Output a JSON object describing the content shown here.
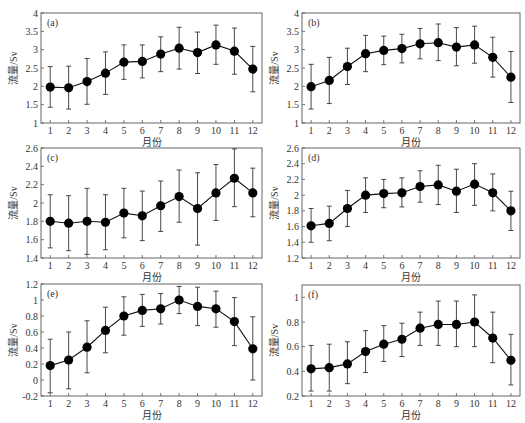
{
  "figure": {
    "xlabel": "月份",
    "ylabel": "流量/Sv",
    "months": [
      "1",
      "2",
      "3",
      "4",
      "5",
      "6",
      "7",
      "8",
      "9",
      "10",
      "11",
      "12"
    ]
  },
  "chart_data": [
    {
      "type": "line",
      "panel": "(a)",
      "xlabel": "月份",
      "ylabel": "流量/Sv",
      "x": [
        1,
        2,
        3,
        4,
        5,
        6,
        7,
        8,
        9,
        10,
        11,
        12
      ],
      "ylim": [
        1,
        4
      ],
      "yticks": [
        "1",
        "1.5",
        "2",
        "2.5",
        "3",
        "3.5",
        "4"
      ],
      "yticks_num": [
        1,
        1.5,
        2,
        2.5,
        3,
        3.5,
        4
      ],
      "values": [
        1.98,
        1.96,
        2.13,
        2.36,
        2.66,
        2.68,
        2.88,
        3.04,
        2.92,
        3.13,
        2.96,
        2.47
      ],
      "err_low": [
        1.43,
        1.38,
        1.51,
        1.78,
        2.19,
        2.23,
        2.4,
        2.47,
        2.35,
        2.6,
        2.33,
        1.85
      ],
      "err_high": [
        2.54,
        2.55,
        2.76,
        2.94,
        3.13,
        3.13,
        3.35,
        3.61,
        3.48,
        3.67,
        3.59,
        3.09
      ],
      "grid": false,
      "markers": "filled-circle",
      "frame": {
        "left": 41,
        "top": 13,
        "right": 262,
        "bottom": 123
      }
    },
    {
      "type": "line",
      "panel": "(b)",
      "xlabel": "月份",
      "ylabel": "流量/Sv",
      "x": [
        1,
        2,
        3,
        4,
        5,
        6,
        7,
        8,
        9,
        10,
        11,
        12
      ],
      "ylim": [
        1,
        4
      ],
      "yticks": [
        "1",
        "1.5",
        "2",
        "2.5",
        "3",
        "3.5",
        "4"
      ],
      "yticks_num": [
        1,
        1.5,
        2,
        2.5,
        3,
        3.5,
        4
      ],
      "values": [
        1.99,
        2.16,
        2.54,
        2.89,
        2.98,
        3.03,
        3.16,
        3.19,
        3.07,
        3.13,
        2.79,
        2.25
      ],
      "err_low": [
        1.38,
        1.53,
        2.05,
        2.4,
        2.59,
        2.64,
        2.75,
        2.7,
        2.56,
        2.63,
        2.25,
        1.56
      ],
      "err_high": [
        2.6,
        2.79,
        3.04,
        3.39,
        3.37,
        3.42,
        3.58,
        3.7,
        3.6,
        3.64,
        3.34,
        2.95
      ],
      "grid": false,
      "markers": "filled-circle",
      "frame": {
        "left": 302,
        "top": 13,
        "right": 520,
        "bottom": 123
      }
    },
    {
      "type": "line",
      "panel": "(c)",
      "xlabel": "月份",
      "ylabel": "流量/Sv",
      "x": [
        1,
        2,
        3,
        4,
        5,
        6,
        7,
        8,
        9,
        10,
        11,
        12
      ],
      "ylim": [
        1.4,
        2.6
      ],
      "yticks": [
        "1.4",
        "1.6",
        "1.8",
        "2",
        "2.2",
        "2.4",
        "2.6"
      ],
      "yticks_num": [
        1.4,
        1.6,
        1.8,
        2.0,
        2.2,
        2.4,
        2.6
      ],
      "values": [
        1.8,
        1.78,
        1.8,
        1.79,
        1.89,
        1.86,
        1.97,
        2.07,
        1.94,
        2.11,
        2.27,
        2.11
      ],
      "err_low": [
        1.51,
        1.48,
        1.44,
        1.49,
        1.62,
        1.59,
        1.69,
        1.79,
        1.54,
        1.81,
        1.96,
        1.85
      ],
      "err_high": [
        2.09,
        2.08,
        2.16,
        2.09,
        2.16,
        2.13,
        2.24,
        2.36,
        2.33,
        2.42,
        2.59,
        2.38
      ],
      "grid": false,
      "markers": "filled-circle",
      "frame": {
        "left": 41,
        "top": 148,
        "right": 262,
        "bottom": 258
      }
    },
    {
      "type": "line",
      "panel": "(d)",
      "xlabel": "月份",
      "ylabel": "流量/Sv",
      "x": [
        1,
        2,
        3,
        4,
        5,
        6,
        7,
        8,
        9,
        10,
        11,
        12
      ],
      "ylim": [
        1.2,
        2.6
      ],
      "yticks": [
        "1.2",
        "1.4",
        "1.6",
        "1.8",
        "2",
        "2.2",
        "2.4",
        "2.6"
      ],
      "yticks_num": [
        1.2,
        1.4,
        1.6,
        1.8,
        2.0,
        2.2,
        2.4,
        2.6
      ],
      "values": [
        1.61,
        1.64,
        1.83,
        2.0,
        2.02,
        2.03,
        2.11,
        2.13,
        2.05,
        2.14,
        2.03,
        1.8
      ],
      "err_low": [
        1.4,
        1.42,
        1.6,
        1.78,
        1.84,
        1.85,
        1.91,
        1.88,
        1.78,
        1.87,
        1.8,
        1.55
      ],
      "err_high": [
        1.83,
        1.86,
        2.06,
        2.22,
        2.2,
        2.22,
        2.31,
        2.38,
        2.33,
        2.4,
        2.27,
        2.05
      ],
      "grid": false,
      "markers": "filled-circle",
      "frame": {
        "left": 302,
        "top": 148,
        "right": 520,
        "bottom": 258
      }
    },
    {
      "type": "line",
      "panel": "(e)",
      "xlabel": "月份",
      "ylabel": "流量/Sv",
      "x": [
        1,
        2,
        3,
        4,
        5,
        6,
        7,
        8,
        9,
        10,
        11,
        12
      ],
      "ylim": [
        -0.2,
        1.2
      ],
      "yticks": [
        "-0.2",
        "0",
        "0.2",
        "0.4",
        "0.6",
        "0.8",
        "1",
        "1.2"
      ],
      "yticks_num": [
        -0.2,
        0,
        0.2,
        0.4,
        0.6,
        0.8,
        1.0,
        1.2
      ],
      "values": [
        0.18,
        0.25,
        0.41,
        0.62,
        0.8,
        0.87,
        0.89,
        1.0,
        0.92,
        0.89,
        0.73,
        0.39
      ],
      "err_low": [
        -0.16,
        -0.11,
        0.09,
        0.34,
        0.56,
        0.67,
        0.7,
        0.83,
        0.68,
        0.66,
        0.43,
        0.0
      ],
      "err_high": [
        0.51,
        0.6,
        0.74,
        0.91,
        1.04,
        1.07,
        1.08,
        1.17,
        1.16,
        1.11,
        1.03,
        0.79
      ],
      "grid": false,
      "markers": "filled-circle",
      "frame": {
        "left": 41,
        "top": 284,
        "right": 262,
        "bottom": 396
      }
    },
    {
      "type": "line",
      "panel": "(f)",
      "xlabel": "月份",
      "ylabel": "流量/Sv",
      "x": [
        1,
        2,
        3,
        4,
        5,
        6,
        7,
        8,
        9,
        10,
        11,
        12
      ],
      "ylim": [
        0.2,
        1.1
      ],
      "yticks": [
        "0.2",
        "0.4",
        "0.6",
        "0.8",
        "1"
      ],
      "yticks_num": [
        0.2,
        0.4,
        0.6,
        0.8,
        1.0
      ],
      "values": [
        0.42,
        0.43,
        0.46,
        0.56,
        0.62,
        0.66,
        0.75,
        0.78,
        0.78,
        0.8,
        0.67,
        0.49
      ],
      "err_low": [
        0.24,
        0.24,
        0.3,
        0.39,
        0.48,
        0.52,
        0.61,
        0.61,
        0.6,
        0.6,
        0.47,
        0.29
      ],
      "err_high": [
        0.61,
        0.62,
        0.64,
        0.73,
        0.77,
        0.79,
        0.88,
        0.97,
        0.97,
        1.02,
        0.88,
        0.7
      ],
      "grid": false,
      "markers": "filled-circle",
      "frame": {
        "left": 302,
        "top": 285,
        "right": 520,
        "bottom": 396
      }
    }
  ]
}
